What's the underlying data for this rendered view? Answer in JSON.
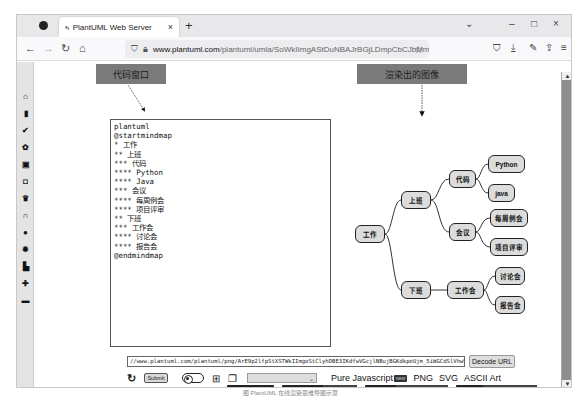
{
  "browser": {
    "tab": {
      "favicon": "PlantUML-icon",
      "title": "PlantUML Web Server",
      "close": "×"
    },
    "new_tab": "+",
    "window_controls": {
      "list_tabs": "⌄",
      "minimize": "–",
      "maximize": "□",
      "close": "×"
    },
    "nav": {
      "back": "←",
      "forward": "→",
      "reload": "↻",
      "home": "⌂"
    },
    "url": {
      "domain": "www.plantuml.com",
      "path": "/plantuml/umla/SoWkIImgAStDuNBAJrBGjLDmpCbCJbMmKiX8pSd0..."
    },
    "toolbar_icons": [
      "pocket-icon",
      "download-icon",
      "extensions-icon",
      "share-icon",
      "menu-icon"
    ]
  },
  "sidebar": {
    "icons": [
      "home-icon",
      "bookmark-icon",
      "pen-icon",
      "lightbulb-icon",
      "media-icon",
      "shield-icon",
      "crown-icon",
      "headphones-icon",
      "palette-icon",
      "gear-icon",
      "chart-icon",
      "plus-icon",
      "monitor-icon"
    ]
  },
  "annotations": {
    "code_window": "代码窗口",
    "rendered_image": "渲染出的图像"
  },
  "editor": {
    "lines": [
      "plantuml",
      "@startmindmap",
      "* 工作",
      "** 上班",
      "*** 代码",
      "**** Python",
      "**** Java",
      "*** 会议",
      "**** 每周例会",
      "**** 项目评审",
      "** 下班",
      "*** 工作会",
      "**** 讨论会",
      "**** 报告会",
      "@endmindmap"
    ]
  },
  "mindmap": {
    "root": "工作",
    "nodes": {
      "shangban": "上班",
      "daima": "代码",
      "python": "Python",
      "java": "java",
      "huiyi": "会议",
      "meizhou": "每周例会",
      "xiangmu": "项目评审",
      "xiaban": "下班",
      "gongzuohui": "工作会",
      "taolun": "讨论会",
      "baogao": "报告会"
    }
  },
  "controls": {
    "encoded_url": "//www.plantuml.com/plantuml/png/ArE9p2lfpStXSTWkIImgoStClyhDBE3IKdfwVGcjlNBujBGKdkpeUjm_5iWGCdSlVhwW4S9W4lWCglpBoyo1lby",
    "decode_button": "Decode URL",
    "submit_button": "Submit",
    "select_value": "",
    "formats": {
      "pure_js": "Pure Javascript",
      "pure_js_badge": "NEW",
      "png": "PNG",
      "svg": "SVG",
      "ascii": "ASCII Art"
    }
  },
  "stats": [
    {
      "key": "chat",
      "value": "31 online",
      "icon": "discord-icon"
    },
    {
      "key": "online diagrams",
      "value": "241,108,313"
    },
    {
      "key": "current rate",
      "value": "252 diag. per minute"
    },
    {
      "key": "peak rate",
      "value": "1046 diag. per minute"
    }
  ],
  "caption": "图 PlantUML 在线渲染思维导图示意"
}
